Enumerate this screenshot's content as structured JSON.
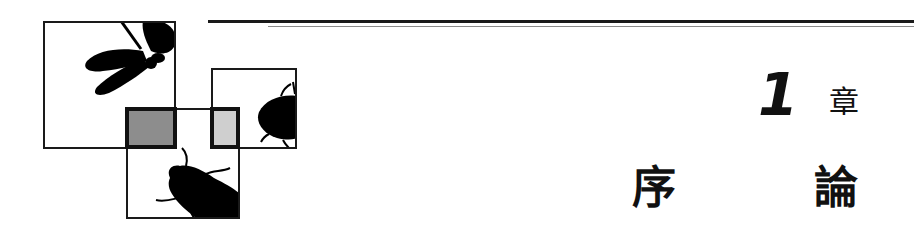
{
  "header": {
    "chapter_number": "1",
    "chapter_label": "章",
    "title_chars": [
      "序",
      "論"
    ]
  },
  "illustration": {
    "icons": [
      "dragonfly-icon",
      "beetle-icon",
      "ladybug-icon"
    ],
    "colors": {
      "line": "#1a1a1a",
      "dark_square": "#8d8d8d",
      "light_square": "#cfcfcf",
      "thin_rule": "#8a8a8a"
    }
  }
}
